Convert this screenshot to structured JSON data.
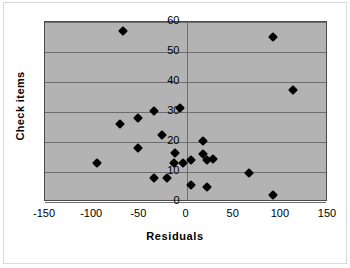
{
  "chart_data": {
    "type": "scatter",
    "title": "",
    "xlabel": "Residuals",
    "ylabel": "Check items",
    "xlim": [
      -150,
      150
    ],
    "ylim": [
      0,
      60
    ],
    "xticks": [
      "-150",
      "-100",
      "-50",
      "0",
      "50",
      "100",
      "150"
    ],
    "xtick_values": [
      -150,
      -100,
      -50,
      0,
      50,
      100,
      150
    ],
    "yticks": [
      "0",
      "10",
      "20",
      "30",
      "40",
      "50",
      "60"
    ],
    "ytick_values": [
      0,
      10,
      20,
      30,
      40,
      50,
      60
    ],
    "grid": "horizontal",
    "legend": "none",
    "marker": "diamond",
    "marker_color": "#000000",
    "plot_background": "#b3b3b3",
    "series": [
      {
        "name": "Check items vs Residuals",
        "points": [
          {
            "x": -67,
            "y": 57
          },
          {
            "x": 92,
            "y": 55
          },
          {
            "x": 113,
            "y": 37.5
          },
          {
            "x": -7,
            "y": 31.5
          },
          {
            "x": -34,
            "y": 30.5
          },
          {
            "x": -51,
            "y": 28
          },
          {
            "x": -71,
            "y": 26
          },
          {
            "x": -26,
            "y": 22.5
          },
          {
            "x": 17,
            "y": 20.5
          },
          {
            "x": -51,
            "y": 18
          },
          {
            "x": -12,
            "y": 16.5
          },
          {
            "x": 17,
            "y": 16
          },
          {
            "x": 28,
            "y": 14.5
          },
          {
            "x": 22,
            "y": 14
          },
          {
            "x": 5,
            "y": 14
          },
          {
            "x": -13,
            "y": 13
          },
          {
            "x": -4,
            "y": 13
          },
          {
            "x": -95,
            "y": 13
          },
          {
            "x": 66,
            "y": 9.8
          },
          {
            "x": -34,
            "y": 8
          },
          {
            "x": -21,
            "y": 8
          },
          {
            "x": 5,
            "y": 5.8
          },
          {
            "x": 22,
            "y": 5
          },
          {
            "x": 92,
            "y": 2.5
          }
        ]
      }
    ]
  },
  "axes": {
    "x_title": "Residuals",
    "y_title": "Check items"
  }
}
